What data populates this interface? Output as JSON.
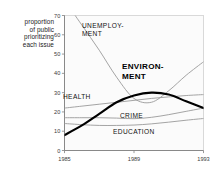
{
  "chart_data": {
    "type": "line",
    "title": "",
    "subtitle": "",
    "xlabel": "",
    "ylabel": "proportion of public prioritizing each issue",
    "ylabel_lines": [
      "proportion",
      "of public",
      "prioritizing",
      "each  issue"
    ],
    "xlim": [
      1985,
      1993
    ],
    "ylim": [
      0,
      70
    ],
    "yticks": [
      0,
      10,
      20,
      30,
      40,
      50,
      60,
      70
    ],
    "ytick_labels": [
      "0",
      "10",
      "20",
      "30",
      "40",
      "50",
      "60",
      "70"
    ],
    "xticks": [
      1985,
      1989,
      1993
    ],
    "xtick_labels": [
      "1985",
      "1989",
      "1993"
    ],
    "grid": false,
    "legend": "inline-annotations",
    "x": [
      1985,
      1986,
      1987,
      1988,
      1989,
      1990,
      1991,
      1992,
      1993
    ],
    "series": [
      {
        "name": "ENVIRONMENT",
        "label_lines": [
          "ENVIRON-",
          "MENT"
        ],
        "emphasis": "bold",
        "color": "#000000",
        "width": 2.1,
        "values": [
          8,
          13,
          19,
          25,
          28.5,
          30,
          29,
          25.5,
          22
        ]
      },
      {
        "name": "UNEMPLOYMENT",
        "label_lines": [
          "UNEMPLOY-",
          "MENT"
        ],
        "emphasis": "normal",
        "color": "#9a9a9a",
        "width": 0.9,
        "values": [
          78,
          65,
          52,
          38,
          27,
          25,
          31,
          39,
          46
        ]
      },
      {
        "name": "HEALTH",
        "label_lines": [
          "HEALTH"
        ],
        "emphasis": "normal",
        "color": "#9a9a9a",
        "width": 0.9,
        "values": [
          22,
          23,
          24,
          25,
          26,
          27,
          27.8,
          28.5,
          29
        ]
      },
      {
        "name": "CRIME",
        "label_lines": [
          "CRIME"
        ],
        "emphasis": "normal",
        "color": "#9a9a9a",
        "width": 0.9,
        "values": [
          17,
          17,
          17,
          16.8,
          16.5,
          17.2,
          18.6,
          20.3,
          22
        ]
      },
      {
        "name": "EDUCATION",
        "label_lines": [
          "EDUCATION"
        ],
        "emphasis": "normal",
        "color": "#9a9a9a",
        "width": 0.9,
        "values": [
          14,
          13.4,
          13,
          13,
          13.2,
          13.8,
          14.7,
          15.7,
          16.6
        ]
      }
    ],
    "colors": {
      "axis": "#808080",
      "plot_background": "#fbfbfb",
      "plot_border": "#c9c9c9",
      "grey_series": "#9a9a9a",
      "emphasis_series": "#000000",
      "text": "#1a1a1a"
    }
  }
}
